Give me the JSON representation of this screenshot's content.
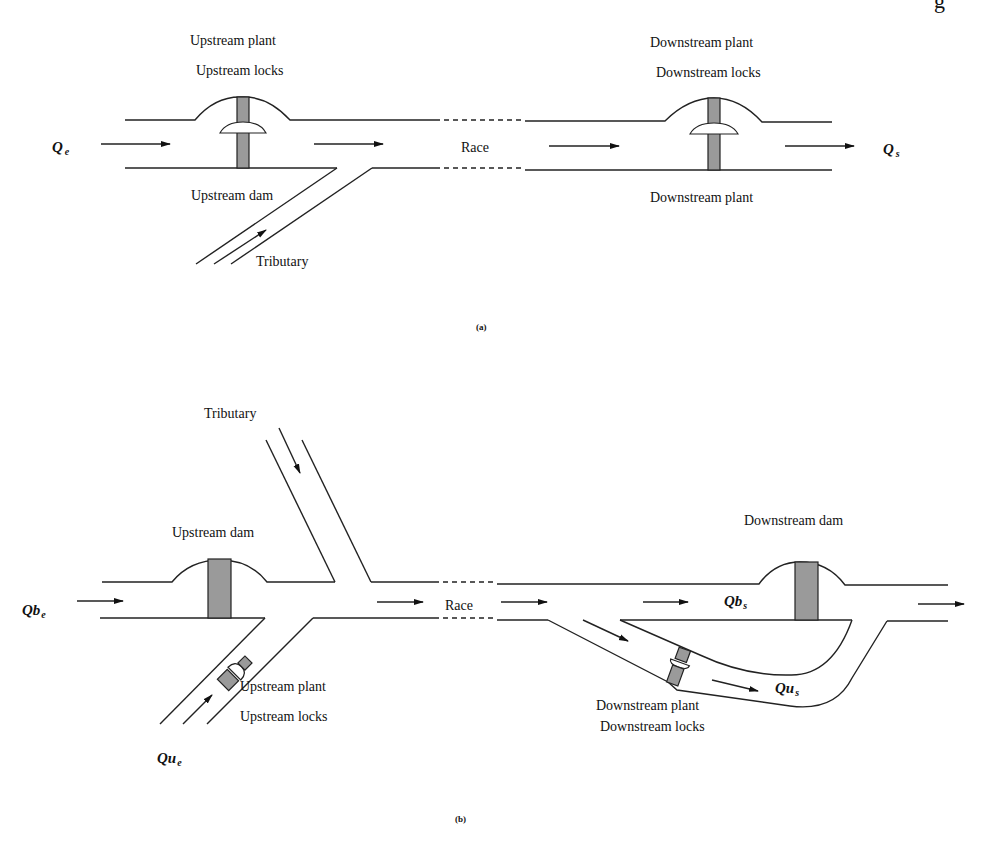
{
  "figure_a": {
    "caption": "(a)",
    "labels": {
      "upstream_plant": "Upstream plant",
      "upstream_locks": "Upstream locks",
      "upstream_dam": "Upstream dam",
      "tributary": "Tributary",
      "race": "Race",
      "downstream_plant_top": "Downstream plant",
      "downstream_locks": "Downstream locks",
      "downstream_plant_bottom": "Downstream plant"
    },
    "symbols": {
      "inflow": "Q",
      "inflow_sub": "e",
      "outflow": "Q",
      "outflow_sub": "s"
    }
  },
  "figure_b": {
    "caption": "(b)",
    "labels": {
      "tributary": "Tributary",
      "upstream_dam": "Upstream dam",
      "race": "Race",
      "downstream_dam": "Downstream dam",
      "upstream_plant": "Upstream plant",
      "upstream_locks": "Upstream locks",
      "downstream_plant": "Downstream plant",
      "downstream_locks": "Downstream locks"
    },
    "symbols": {
      "qb_in": "Qb",
      "qb_in_sub": "e",
      "qu_in": "Qu",
      "qu_in_sub": "e",
      "qb_out": "Qb",
      "qb_out_sub": "s",
      "qu_out": "Qu",
      "qu_out_sub": "s"
    }
  },
  "header_fragment": "g"
}
